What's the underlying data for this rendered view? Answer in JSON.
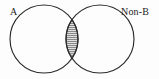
{
  "figure": {
    "name": "venn-diagram",
    "background_color": "#fdfdfd",
    "stroke_color": "#2b2b2b",
    "hatch_color": "#3a3a3a",
    "width": 159,
    "height": 79
  },
  "sets": {
    "left": {
      "label": "A",
      "center_x": 44,
      "center_y": 39,
      "radius": 34,
      "shaded": false
    },
    "right": {
      "label": "Non-B",
      "center_x": 100,
      "center_y": 39,
      "radius": 34,
      "shaded": false
    }
  },
  "intersection": {
    "name": "A and Non-B",
    "shaded": true,
    "fill_style": "horizontal-hatch",
    "hatch_spacing": 2,
    "top_x": 72,
    "top_y": 14,
    "bottom_x": 72,
    "bottom_y": 64
  }
}
